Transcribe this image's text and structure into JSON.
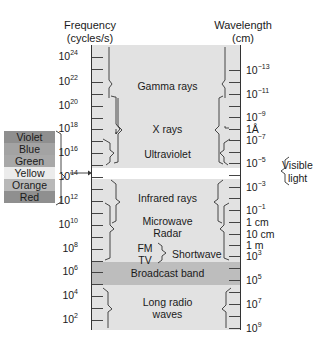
{
  "diagram": {
    "title_left": "Frequency",
    "subtitle_left": "(cycles/s)",
    "title_right": "Wavelength",
    "subtitle_right": "(cm)",
    "frequency_ticks": [
      {
        "base": "10",
        "exp": "24",
        "y": 57
      },
      {
        "base": "10",
        "exp": "22",
        "y": 82
      },
      {
        "base": "10",
        "exp": "20",
        "y": 106
      },
      {
        "base": "10",
        "exp": "18",
        "y": 129
      },
      {
        "base": "10",
        "exp": "16",
        "y": 153
      },
      {
        "base": "10",
        "exp": "14",
        "y": 177
      },
      {
        "base": "10",
        "exp": "12",
        "y": 201
      },
      {
        "base": "10",
        "exp": "10",
        "y": 225
      },
      {
        "base": "10",
        "exp": "8",
        "y": 249
      },
      {
        "base": "10",
        "exp": "6",
        "y": 272
      },
      {
        "base": "10",
        "exp": "4",
        "y": 296
      },
      {
        "base": "10",
        "exp": "2",
        "y": 320
      }
    ],
    "wavelength_ticks": [
      {
        "base": "10",
        "exp": "−13",
        "y": 70
      },
      {
        "base": "10",
        "exp": "−11",
        "y": 94
      },
      {
        "base": "10",
        "exp": "−9",
        "y": 117
      },
      {
        "base": "1Å",
        "exp": "",
        "y": 129
      },
      {
        "base": "10",
        "exp": "−7",
        "y": 140
      },
      {
        "base": "10",
        "exp": "−5",
        "y": 163
      },
      {
        "base": "10",
        "exp": "−3",
        "y": 187
      },
      {
        "base": "10",
        "exp": "−1",
        "y": 210
      },
      {
        "base": "1 cm",
        "exp": "",
        "y": 222
      },
      {
        "base": "10 cm",
        "exp": "",
        "y": 234
      },
      {
        "base": "1 m",
        "exp": "",
        "y": 245
      },
      {
        "base": "10",
        "exp": "3",
        "y": 256
      },
      {
        "base": "10",
        "exp": "5",
        "y": 280
      },
      {
        "base": "10",
        "exp": "7",
        "y": 304
      },
      {
        "base": "10",
        "exp": "9",
        "y": 328
      }
    ],
    "bands": {
      "gamma": "Gamma rays",
      "xray": "X rays",
      "uv": "Ultraviolet",
      "infrared": "Infrared rays",
      "microwave": "Microwave",
      "radar": "Radar",
      "fm": "FM",
      "tv": "TV",
      "shortwave": "Shortwave",
      "broadcast": "Broadcast band",
      "long1": "Long radio",
      "long2": "waves"
    },
    "visible_light_label_1": "Visible",
    "visible_light_label_2": "light",
    "visible_colors": [
      {
        "name": "Violet",
        "color": "#8f8f8f"
      },
      {
        "name": "Blue",
        "color": "#a3a3a3"
      },
      {
        "name": "Green",
        "color": "#a8a8a8"
      },
      {
        "name": "Yellow",
        "color": "#ececec"
      },
      {
        "name": "Orange",
        "color": "#b8b8b8"
      },
      {
        "name": "Red",
        "color": "#8f8f8f"
      }
    ],
    "colors": {
      "panel": "#e2e2e2",
      "broadcast": "#bdbdbd",
      "gap": "#ffffff"
    }
  }
}
